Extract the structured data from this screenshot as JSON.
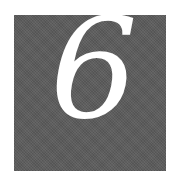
{
  "tile": {
    "numeral": "6",
    "background_color": "#5c5c5c",
    "text_color": "#ffffff"
  }
}
